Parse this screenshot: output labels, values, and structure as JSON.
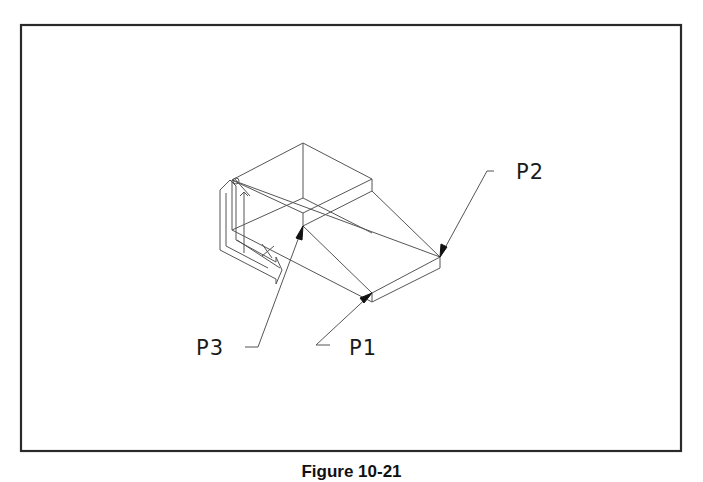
{
  "figure": {
    "caption": "Figure 10-21",
    "labels": {
      "p1": "P1",
      "p2": "P2",
      "p3": "P3"
    },
    "colors": {
      "line": "#555555",
      "border": "#2a2a2a",
      "text": "#1a1a1a"
    }
  }
}
